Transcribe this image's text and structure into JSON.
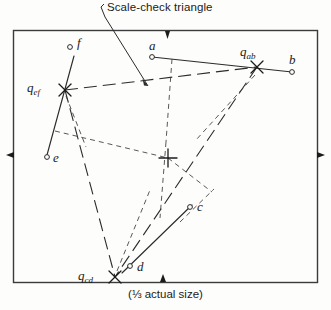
{
  "figure": {
    "callout_label": "Scale-check triangle",
    "caption": "(⅓ actual size)",
    "border_color": "#3b3b3b",
    "line_color": "#2b2b2b",
    "background": "#fdfdfc"
  },
  "points": [
    {
      "id": "f",
      "label": "f",
      "marker": "circle",
      "x": 70,
      "y": 47,
      "label_x": 77,
      "label_y": 42
    },
    {
      "id": "a",
      "label": "a",
      "marker": "circle",
      "x": 152,
      "y": 57,
      "label_x": 150,
      "label_y": 40
    },
    {
      "id": "b",
      "label": "b",
      "marker": "circle",
      "x": 292,
      "y": 72,
      "label_x": 291,
      "label_y": 54
    },
    {
      "id": "e",
      "label": "e",
      "marker": "circle",
      "x": 47,
      "y": 157,
      "label_x": 53,
      "label_y": 155
    },
    {
      "id": "c",
      "label": "c",
      "marker": "circle",
      "x": 190,
      "y": 207,
      "label_x": 197,
      "label_y": 203
    },
    {
      "id": "d",
      "label": "d",
      "marker": "circle",
      "x": 130,
      "y": 266,
      "label_x": 137,
      "label_y": 264
    },
    {
      "id": "q_ab",
      "label": "qab",
      "marker": "cross-x",
      "x": 257,
      "y": 67,
      "label_x": 240,
      "label_y": 47
    },
    {
      "id": "q_ef",
      "label": "qef",
      "marker": "cross-x",
      "x": 65,
      "y": 90,
      "label_x": 27,
      "label_y": 84
    },
    {
      "id": "q_cd",
      "label": "qcd",
      "marker": "cross-x",
      "x": 115,
      "y": 277,
      "label_x": 78,
      "label_y": 271
    },
    {
      "id": "q_int",
      "label": "",
      "marker": "cross-plus",
      "x": 168,
      "y": 158,
      "label_x": 0,
      "label_y": 0
    }
  ],
  "point_labels": [
    {
      "id": "f",
      "base": "f",
      "sub": ""
    },
    {
      "id": "a",
      "base": "a",
      "sub": ""
    },
    {
      "id": "b",
      "base": "b",
      "sub": ""
    },
    {
      "id": "e",
      "base": "e",
      "sub": ""
    },
    {
      "id": "c",
      "base": "c",
      "sub": ""
    },
    {
      "id": "d",
      "base": "d",
      "sub": ""
    },
    {
      "id": "q_ab",
      "base": "q",
      "sub": "ab"
    },
    {
      "id": "q_ef",
      "base": "q",
      "sub": "ef"
    },
    {
      "id": "q_cd",
      "base": "q",
      "sub": "cd"
    }
  ],
  "border_ticks": [
    {
      "side": "top",
      "pos": 165
    },
    {
      "side": "left",
      "pos": 155
    },
    {
      "side": "right",
      "pos": 155
    },
    {
      "side": "bottom",
      "pos": 163
    }
  ]
}
